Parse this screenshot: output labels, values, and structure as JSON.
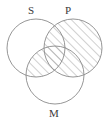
{
  "figure": {
    "type": "venn-diagram",
    "background_color": "#ffffff",
    "stroke_color": "#8a8a8a",
    "hatch_color": "#8a8a8a",
    "label_color": "#3a3a3a",
    "width": 110,
    "height": 121
  },
  "circles": [
    {
      "id": "S",
      "label": "S",
      "cx": 36,
      "cy": 48,
      "r": 29,
      "label_x": 31,
      "label_y": 14,
      "shaded": false
    },
    {
      "id": "P",
      "label": "P",
      "cx": 73,
      "cy": 48,
      "r": 29,
      "label_x": 68,
      "label_y": 14,
      "shaded": true
    },
    {
      "id": "M",
      "label": "M",
      "cx": 55,
      "cy": 75,
      "r": 29,
      "label_x": 54,
      "label_y": 117,
      "shaded": false
    }
  ],
  "shaded_regions": [
    {
      "name": "P",
      "expression": "P"
    },
    {
      "name": "S-and-M",
      "expression": "S ∩ M"
    }
  ],
  "hatch": {
    "angle": "45deg",
    "direction": "forward-slash",
    "spacing": 6,
    "line_width": 0.8
  }
}
